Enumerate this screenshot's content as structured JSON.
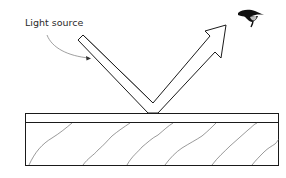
{
  "diagram": {
    "labels": {
      "light_source": "Light source"
    },
    "colors": {
      "stroke": "#1a1a1a",
      "grain": "#555555",
      "pointer": "#888888",
      "eye": "#111111",
      "iris": "#bbbbbb",
      "background": "#ffffff"
    },
    "elements": [
      "incident-light-beam",
      "reflected-light-arrow",
      "observer-eye",
      "surface-coating-layer",
      "wood-substrate"
    ]
  }
}
